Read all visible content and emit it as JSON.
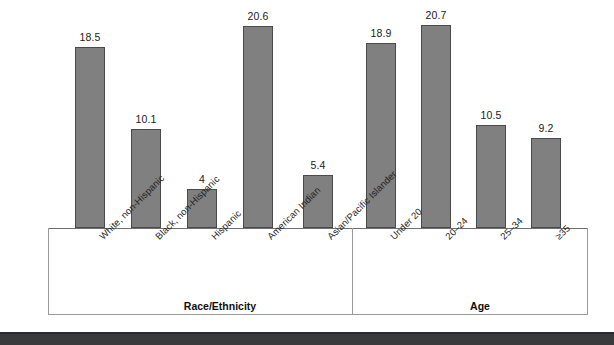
{
  "chart_data": {
    "type": "bar",
    "title": "",
    "subtitle": "",
    "xlabel": "",
    "ylabel": "",
    "ylim": [
      0,
      23
    ],
    "grid": false,
    "legend": "none",
    "groups": [
      {
        "name": "Race/Ethnicity",
        "categories": [
          "White, non-Hispanic",
          "Black, non-Hispanic",
          "Hispanic",
          "American Indian",
          "Asian/Pacific Islander"
        ],
        "values": [
          18.5,
          10.1,
          4,
          20.6,
          5.4
        ],
        "value_labels": [
          "18.5",
          "10.1",
          "4",
          "20.6",
          "5.4"
        ]
      },
      {
        "name": "Age",
        "categories": [
          "Under 20",
          "20–24",
          "25–34",
          "≥35"
        ],
        "values": [
          18.9,
          20.7,
          10.5,
          9.2
        ],
        "value_labels": [
          "18.9",
          "20.7",
          "10.5",
          "9.2"
        ]
      }
    ],
    "categories": [
      "White, non-Hispanic",
      "Black, non-Hispanic",
      "Hispanic",
      "American Indian",
      "Asian/Pacific Islander",
      "Under 20",
      "20–24",
      "25–34",
      "≥35"
    ],
    "values": [
      18.5,
      10.1,
      4,
      20.6,
      5.4,
      18.9,
      20.7,
      10.5,
      9.2
    ],
    "colors": {
      "bar_fill": "#808080",
      "bar_edge": "#4a4a4a",
      "axis": "#8d8d8d",
      "text": "#1a1a1a",
      "footer_band": "#3a3a3c"
    }
  },
  "footer": {
    "caption": ""
  }
}
